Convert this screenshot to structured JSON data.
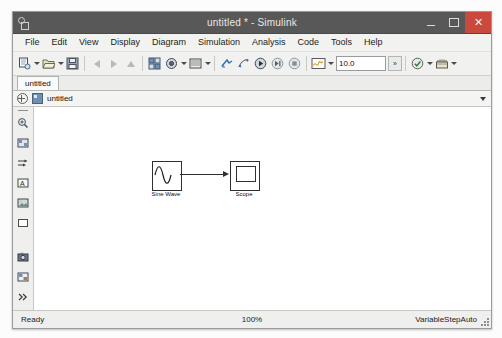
{
  "window": {
    "title": "untitled * - Simulink",
    "app_icon": "simulink-icon",
    "controls": {
      "minimize": "minimize-icon",
      "maximize": "maximize-icon",
      "close": "✕"
    },
    "accent_close": "#c94a3d",
    "titlebar_color": "#585858"
  },
  "menubar": {
    "items": [
      {
        "label": "File"
      },
      {
        "label": "Edit"
      },
      {
        "label": "View"
      },
      {
        "label": "Display"
      },
      {
        "label": "Diagram"
      },
      {
        "label": "Simulation"
      },
      {
        "label": "Analysis"
      },
      {
        "label": "Code"
      },
      {
        "label": "Tools"
      },
      {
        "label": "Help"
      }
    ]
  },
  "toolbar": {
    "simulation_time": "10.0",
    "simulation_time_units_label": "»",
    "buttons": [
      {
        "name": "new-model-icon",
        "has_dropdown": true
      },
      {
        "name": "open-model-icon",
        "has_dropdown": true
      },
      {
        "name": "save-icon",
        "has_dropdown": false
      },
      {
        "name": "back-arrow-icon",
        "has_dropdown": false
      },
      {
        "name": "forward-arrow-icon",
        "has_dropdown": false
      },
      {
        "name": "up-arrow-icon",
        "has_dropdown": false
      },
      {
        "name": "library-browser-icon",
        "has_dropdown": false
      },
      {
        "name": "model-explorer-icon",
        "has_dropdown": true
      },
      {
        "name": "model-configuration-icon",
        "has_dropdown": true
      },
      {
        "name": "update-model-icon",
        "has_dropdown": false
      },
      {
        "name": "fast-restart-icon",
        "has_dropdown": false
      },
      {
        "name": "run-icon",
        "has_dropdown": false
      },
      {
        "name": "step-forward-icon",
        "has_dropdown": false
      },
      {
        "name": "stop-icon",
        "has_dropdown": false
      },
      {
        "name": "simulation-data-inspector-icon",
        "has_dropdown": true
      },
      {
        "name": "model-advisor-icon",
        "has_dropdown": true
      },
      {
        "name": "build-model-icon",
        "has_dropdown": true
      }
    ]
  },
  "tabs": [
    {
      "label": "untitled",
      "active": true
    }
  ],
  "breadcrumb": {
    "zoom_icon": "expand-circle-icon",
    "model_icon": "model-icon",
    "label": "untitled",
    "dropdown_icon": "chevron-down-icon"
  },
  "palette": {
    "items": [
      {
        "name": "zoom-fit-icon"
      },
      {
        "name": "fit-to-view-icon"
      },
      {
        "name": "signal-route-icon"
      },
      {
        "name": "annotation-icon"
      },
      {
        "name": "image-icon"
      },
      {
        "name": "rectangle-icon"
      },
      {
        "name": "camera-icon"
      },
      {
        "name": "subsystem-icon"
      },
      {
        "name": "more-chevron-icon"
      }
    ]
  },
  "canvas": {
    "blocks": [
      {
        "name": "sine-wave-block",
        "label": "Sine Wave"
      },
      {
        "name": "scope-block",
        "label": "Scope"
      }
    ],
    "connection": {
      "name": "signal-line",
      "from": "Sine Wave",
      "to": "Scope"
    }
  },
  "statusbar": {
    "status": "Ready",
    "zoom": "100%",
    "solver": "VariableStepAuto"
  }
}
